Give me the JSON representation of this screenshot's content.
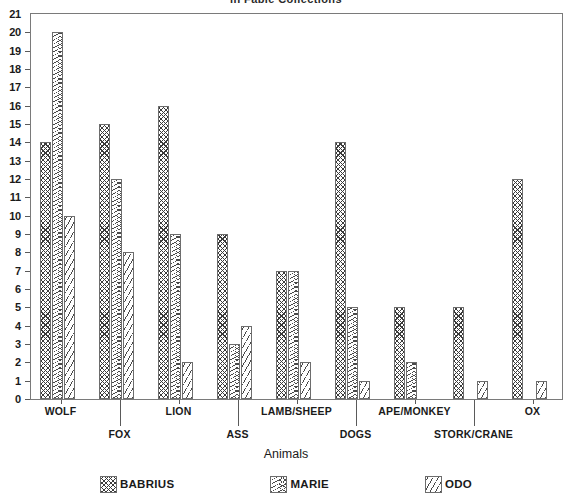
{
  "chart_data": {
    "type": "bar",
    "title": "in Fable Collections",
    "xlabel": "Animals",
    "ylabel": "",
    "ylim": [
      0,
      21
    ],
    "ytick_step": 1,
    "yticks": [
      0,
      1,
      2,
      3,
      4,
      5,
      6,
      7,
      8,
      9,
      10,
      11,
      12,
      13,
      14,
      15,
      16,
      17,
      18,
      19,
      20,
      21
    ],
    "grid": false,
    "legend_position": "bottom",
    "categories": [
      "WOLF",
      "FOX",
      "LION",
      "ASS",
      "LAMB/SHEEP",
      "DOGS",
      "APE/MONKEY",
      "STORK/CRANE",
      "OX"
    ],
    "series": [
      {
        "name": "BABRIUS",
        "pattern": "crosshatch",
        "values": [
          14,
          15,
          16,
          9,
          7,
          14,
          5,
          5,
          12
        ]
      },
      {
        "name": "MARIE",
        "pattern": "chevron",
        "values": [
          20,
          12,
          9,
          3,
          7,
          5,
          2,
          0,
          0
        ]
      },
      {
        "name": "ODO",
        "pattern": "diagonal",
        "values": [
          10,
          8,
          2,
          4,
          2,
          1,
          0,
          1,
          1
        ]
      }
    ]
  },
  "legend": {
    "items": [
      {
        "label": "BABRIUS"
      },
      {
        "label": "MARIE"
      },
      {
        "label": "ODO"
      }
    ]
  }
}
